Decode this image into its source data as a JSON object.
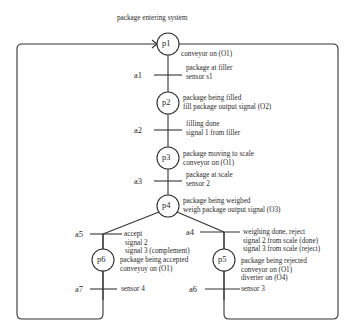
{
  "title": "package entering system",
  "places": [
    {
      "id": "p1",
      "label": "p1",
      "cx": 168,
      "cy": 44,
      "lines": [
        "conveyor on (O1)"
      ]
    },
    {
      "id": "p2",
      "label": "p2",
      "cx": 168,
      "cy": 103,
      "lines": [
        "package being filled",
        "fill package output signal (O2)"
      ]
    },
    {
      "id": "p3",
      "label": "p3",
      "cx": 168,
      "cy": 158,
      "lines": [
        "package moving to scale",
        "conveyor on (O1)"
      ]
    },
    {
      "id": "p4",
      "label": "p4",
      "cx": 168,
      "cy": 206,
      "lines": [
        "package being weighed",
        "weigh package output signal (O3)"
      ]
    },
    {
      "id": "p5",
      "label": "p5",
      "cx": 224,
      "cy": 260,
      "lines": [
        "package being rejected",
        "conveyor on (O1)",
        "diverter on (O4)"
      ]
    },
    {
      "id": "p6",
      "label": "p6",
      "cx": 103,
      "cy": 260,
      "lines": [
        "package being accepted",
        "conveyoy on (O1)"
      ]
    }
  ],
  "transitions": [
    {
      "id": "a1",
      "label": "a1",
      "lines": [
        "package at filler",
        "sensor s1"
      ]
    },
    {
      "id": "a2",
      "label": "a2",
      "lines": [
        "filling done",
        "signal 1 from filler"
      ]
    },
    {
      "id": "a3",
      "label": "a3",
      "lines": [
        "package at scale",
        "sensor 2"
      ]
    },
    {
      "id": "a4",
      "label": "a4",
      "lines": [
        "weighing done, reject",
        "signal 2 from scale (done)",
        "signal 3 from scale (reject)"
      ]
    },
    {
      "id": "a5",
      "label": "a5",
      "lines": [
        "accept",
        "signal 2",
        "signal 3  (complement)"
      ]
    },
    {
      "id": "a6",
      "label": "a6",
      "lines": [
        "sensor 3"
      ]
    },
    {
      "id": "a7",
      "label": "a7",
      "lines": [
        "sensor 4"
      ]
    }
  ],
  "colors": {
    "line": "#333333",
    "text": "#2a2a2a",
    "background": "#ffffff"
  }
}
